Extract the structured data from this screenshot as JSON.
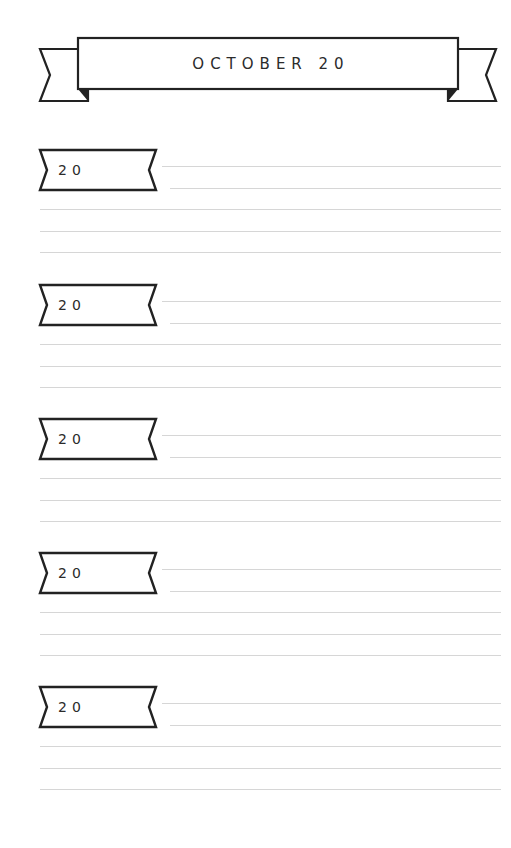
{
  "page": {
    "type": "journal-page",
    "background": "#ffffff",
    "ink_color": "#222222",
    "rule_color": "#d6d6d6"
  },
  "banner": {
    "title": "OCTOBER 20",
    "icon": "ribbon-banner"
  },
  "entries": [
    {
      "year_label": "20",
      "icon": "ribbon-tag",
      "lines": 5
    },
    {
      "year_label": "20",
      "icon": "ribbon-tag",
      "lines": 5
    },
    {
      "year_label": "20",
      "icon": "ribbon-tag",
      "lines": 5
    },
    {
      "year_label": "20",
      "icon": "ribbon-tag",
      "lines": 5
    },
    {
      "year_label": "20",
      "icon": "ribbon-tag",
      "lines": 5
    }
  ]
}
